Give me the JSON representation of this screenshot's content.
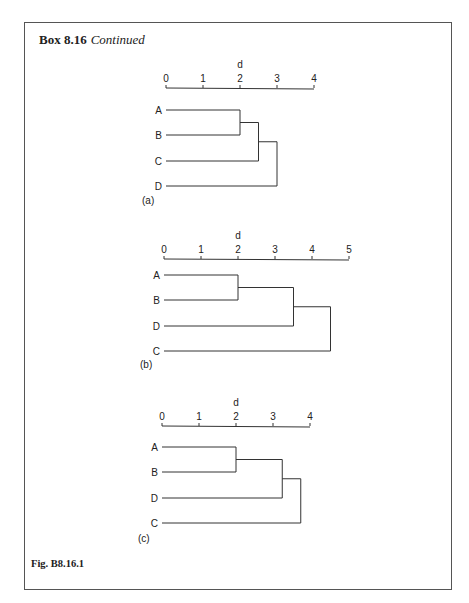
{
  "box": {
    "title_bold": "Box 8.16",
    "title_italic": "Continued",
    "figure_label": "Fig. B8.16.1"
  },
  "chart_data": [
    {
      "type": "dendrogram",
      "panel": "(a)",
      "axis_label": "d",
      "ticks": [
        0,
        1,
        2,
        3,
        4
      ],
      "leaves": [
        "A",
        "B",
        "C",
        "D"
      ],
      "merges": [
        {
          "join": [
            "A",
            "B"
          ],
          "height": 2.0
        },
        {
          "join": [
            "AB",
            "C"
          ],
          "height": 2.5
        },
        {
          "join": [
            "ABC",
            "D"
          ],
          "height": 3.0
        }
      ]
    },
    {
      "type": "dendrogram",
      "panel": "(b)",
      "axis_label": "d",
      "ticks": [
        0,
        1,
        2,
        3,
        4,
        5
      ],
      "leaves": [
        "A",
        "B",
        "D",
        "C"
      ],
      "merges": [
        {
          "join": [
            "A",
            "B"
          ],
          "height": 2.0
        },
        {
          "join": [
            "AB",
            "D"
          ],
          "height": 3.5
        },
        {
          "join": [
            "ABD",
            "C"
          ],
          "height": 4.5
        }
      ]
    },
    {
      "type": "dendrogram",
      "panel": "(c)",
      "axis_label": "d",
      "ticks": [
        0,
        1,
        2,
        3,
        4
      ],
      "leaves": [
        "A",
        "B",
        "D",
        "C"
      ],
      "merges": [
        {
          "join": [
            "A",
            "B"
          ],
          "height": 2.0
        },
        {
          "join": [
            "AB",
            "D"
          ],
          "height": 3.25
        },
        {
          "join": [
            "ABD",
            "C"
          ],
          "height": 3.75
        }
      ]
    }
  ]
}
